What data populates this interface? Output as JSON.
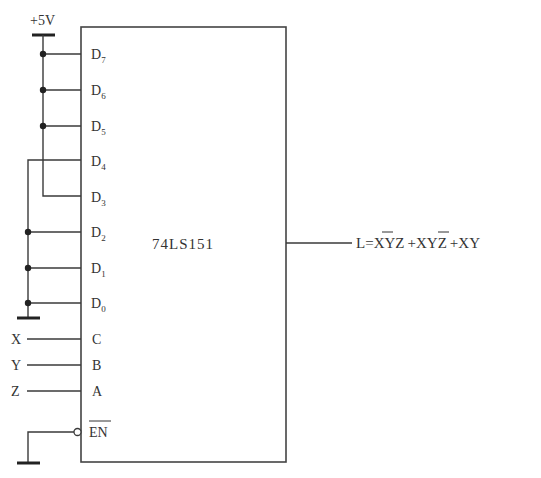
{
  "diagram": {
    "type": "circuit-schematic",
    "chip": {
      "name": "74LS151",
      "data_inputs": [
        {
          "pin": "D",
          "sub": "7",
          "connection": "+5V"
        },
        {
          "pin": "D",
          "sub": "6",
          "connection": "+5V"
        },
        {
          "pin": "D",
          "sub": "5",
          "connection": "+5V"
        },
        {
          "pin": "D",
          "sub": "4",
          "connection": "GND"
        },
        {
          "pin": "D",
          "sub": "3",
          "connection": "+5V"
        },
        {
          "pin": "D",
          "sub": "2",
          "connection": "GND"
        },
        {
          "pin": "D",
          "sub": "1",
          "connection": "GND"
        },
        {
          "pin": "D",
          "sub": "0",
          "connection": "GND"
        }
      ],
      "select_inputs": [
        {
          "pin": "C",
          "signal": "X"
        },
        {
          "pin": "B",
          "signal": "Y"
        },
        {
          "pin": "A",
          "signal": "Z"
        }
      ],
      "enable": {
        "pin": "EN",
        "active_low": true,
        "connection": "GND"
      }
    },
    "supply_label": "+5V",
    "output": {
      "lhs": "L",
      "eq": "=",
      "terms": [
        {
          "parts": [
            {
              "t": "X",
              "bar": true
            },
            {
              "t": "Y",
              "bar": false
            },
            {
              "t": "Z",
              "bar": false
            }
          ]
        },
        {
          "parts": [
            {
              "t": "X",
              "bar": false
            },
            {
              "t": "Y",
              "bar": true
            },
            {
              "t": "Z",
              "bar": false
            }
          ]
        },
        {
          "parts": [
            {
              "t": "X",
              "bar": false
            },
            {
              "t": "Y",
              "bar": false
            }
          ]
        }
      ],
      "plus": "+",
      "text": "L=X̄YZ+XȲZ+XY"
    },
    "colors": {
      "line": "#3a3a3a",
      "text": "#333333",
      "background": "#ffffff"
    }
  }
}
